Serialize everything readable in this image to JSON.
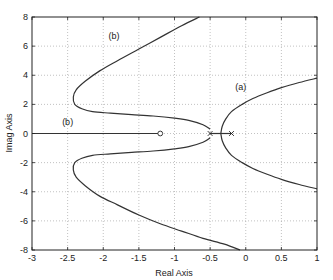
{
  "chart_data": {
    "type": "line",
    "title": "",
    "xlabel": "Real Axis",
    "ylabel": "Imag Axis",
    "xlim": [
      -3,
      1
    ],
    "ylim": [
      -8,
      8
    ],
    "grid": true,
    "xticks": [
      -3,
      -2.5,
      -2,
      -1.5,
      -1,
      -0.5,
      0,
      0.5,
      1
    ],
    "xtick_labels": [
      "-3",
      "-2.5",
      "-2",
      "-1.5",
      "-1",
      "-0.5",
      "0",
      "0.5",
      "1"
    ],
    "yticks": [
      -8,
      -6,
      -4,
      -2,
      0,
      2,
      4,
      6,
      8
    ],
    "ytick_labels": [
      "-8",
      "-6",
      "-4",
      "-2",
      "0",
      "2",
      "4",
      "6",
      "8"
    ],
    "poles": [
      [
        -0.5,
        0
      ],
      [
        -0.2,
        0
      ]
    ],
    "zeros": [
      [
        -1.2,
        0
      ]
    ],
    "series": [
      {
        "name": "(b) upper",
        "x": [
          -0.5,
          -0.6,
          -0.8,
          -1.0,
          -1.3,
          -1.6,
          -1.9,
          -2.15,
          -2.3,
          -2.4,
          -2.42,
          -2.38,
          -2.25,
          -2.05,
          -1.8,
          -1.5,
          -1.2,
          -0.9,
          -0.65
        ],
        "y": [
          0.3,
          0.6,
          0.9,
          1.05,
          1.2,
          1.3,
          1.4,
          1.5,
          1.7,
          2.0,
          2.5,
          3.0,
          3.6,
          4.3,
          5.0,
          5.8,
          6.6,
          7.4,
          8.0
        ]
      },
      {
        "name": "(b) lower",
        "x": [
          -0.5,
          -0.6,
          -0.8,
          -1.0,
          -1.3,
          -1.6,
          -1.9,
          -2.15,
          -2.3,
          -2.4,
          -2.42,
          -2.38,
          -2.25,
          -2.05,
          -1.8,
          -1.5,
          -1.2,
          -0.9,
          -0.6,
          -0.3,
          -0.08
        ],
        "y": [
          -0.3,
          -0.6,
          -0.9,
          -1.05,
          -1.2,
          -1.3,
          -1.4,
          -1.5,
          -1.7,
          -2.0,
          -2.5,
          -3.0,
          -3.6,
          -4.3,
          -4.9,
          -5.6,
          -6.2,
          -6.7,
          -7.2,
          -7.6,
          -8.0
        ]
      },
      {
        "name": "(b) real-axis",
        "x": [
          -3,
          -1.2
        ],
        "y": [
          0,
          0
        ]
      },
      {
        "name": "(a) upper",
        "x": [
          -0.35,
          -0.33,
          -0.28,
          -0.2,
          -0.05,
          0.1,
          0.3,
          0.5,
          0.75,
          1.0
        ],
        "y": [
          0.0,
          0.5,
          1.0,
          1.5,
          2.0,
          2.4,
          2.8,
          3.15,
          3.5,
          3.8
        ]
      },
      {
        "name": "(a) lower",
        "x": [
          -0.35,
          -0.33,
          -0.28,
          -0.2,
          -0.05,
          0.1,
          0.3,
          0.5,
          0.75,
          1.0
        ],
        "y": [
          0.0,
          -0.5,
          -1.0,
          -1.5,
          -2.0,
          -2.4,
          -2.8,
          -3.15,
          -3.5,
          -3.8
        ]
      },
      {
        "name": "(a) real-axis segment",
        "x": [
          -0.5,
          -0.2
        ],
        "y": [
          0,
          0
        ]
      }
    ],
    "annotations": [
      {
        "text": "(b)",
        "x": -1.85,
        "y": 6.5
      },
      {
        "text": "(b)",
        "x": -2.5,
        "y": 0.6
      },
      {
        "text": "(a)",
        "x": -0.07,
        "y": 3.0
      }
    ]
  }
}
